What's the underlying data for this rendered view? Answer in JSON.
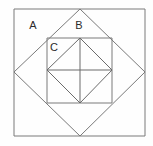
{
  "figure": {
    "canvas": {
      "width": 153,
      "height": 146,
      "background": "#fefefe"
    },
    "style": {
      "stroke_color": "#7a7a7a",
      "stroke_color_dark": "#6b6b6b",
      "stroke_width": 1,
      "label_color": "#2b2b2b",
      "label_font_size": 11
    },
    "labels": [
      {
        "id": "A",
        "text": "A",
        "x": 33,
        "y": 29,
        "region": "outer-square-corner-region"
      },
      {
        "id": "B",
        "text": "B",
        "x": 79,
        "y": 29,
        "region": "diamond-upper-region"
      },
      {
        "id": "C",
        "text": "C",
        "x": 54,
        "y": 51,
        "region": "inner-square-region"
      }
    ],
    "shapes": {
      "outer_square": {
        "name": "outer-square",
        "points": "14,9 145,9 145,136 14,136",
        "left": 14,
        "top": 9,
        "right": 145,
        "bottom": 136,
        "side": 131
      },
      "diamond": {
        "name": "inscribed-diamond",
        "points": "80,9 145,72 80,136 14,72",
        "vertices": {
          "top": [
            80,
            9
          ],
          "right": [
            145,
            72
          ],
          "bottom": [
            80,
            136
          ],
          "left": [
            14,
            72
          ]
        }
      },
      "inner_square": {
        "name": "inner-square",
        "points": "47,38 112,38 112,103 47,103",
        "left": 47,
        "top": 38,
        "right": 112,
        "bottom": 103,
        "side": 65
      },
      "inner_diamond": {
        "name": "inner-inscribed-diamond",
        "points": "80,38 112,70 80,103 47,70",
        "vertices": {
          "top": [
            80,
            38
          ],
          "right": [
            112,
            70
          ],
          "bottom": [
            80,
            103
          ],
          "left": [
            47,
            70
          ]
        }
      },
      "median_horizontal": {
        "name": "median-horizontal-line",
        "x1": 47,
        "y1": 70,
        "x2": 112,
        "y2": 70
      },
      "median_vertical": {
        "name": "median-vertical-line",
        "x1": 80,
        "y1": 38,
        "x2": 80,
        "y2": 103
      }
    }
  }
}
